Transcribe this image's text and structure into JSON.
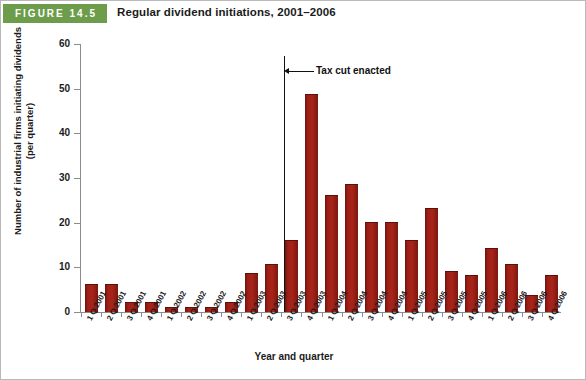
{
  "figure": {
    "badge": "FIGURE 14.5",
    "title": "Regular dividend initiations, 2001–2006",
    "badge_color": "#6d9c4a",
    "bar_color": "#a02118"
  },
  "chart_data": {
    "type": "bar",
    "title": "Regular dividend initiations, 2001–2006",
    "xlabel": "Year and quarter",
    "ylabel": "Number of industrial firms initiating dividends (per quarter)",
    "ylim": [
      0,
      60
    ],
    "yticks": [
      0,
      10,
      20,
      30,
      40,
      50,
      60
    ],
    "grid": false,
    "legend": null,
    "categories": [
      "1 Q 2001",
      "2 Q 2001",
      "3 Q 2001",
      "4 Q 2001",
      "1 Q 2002",
      "2 Q 2002",
      "3 Q 2002",
      "4 Q 2002",
      "1 Q 2003",
      "2 Q 2003",
      "3 Q 2003",
      "4 Q 2003",
      "1 Q 2004",
      "2 Q 2004",
      "3 Q 2004",
      "4 Q 2004",
      "1 Q 2005",
      "2 Q 2005",
      "3 Q 2005",
      "4 Q 2005",
      "1 Q 2006",
      "2 Q 2006",
      "3 Q 2006",
      "4 Q 2006"
    ],
    "values": [
      6,
      6,
      2,
      2,
      1,
      1,
      1,
      2,
      8.5,
      10.5,
      16,
      48.5,
      26,
      28.5,
      20,
      20,
      16,
      23,
      9,
      8,
      14,
      10.5,
      3.5,
      8
    ],
    "annotations": [
      {
        "text": "Tax cut enacted",
        "at_category": "4 Q 2003",
        "type": "vertical-line-with-label"
      }
    ]
  }
}
